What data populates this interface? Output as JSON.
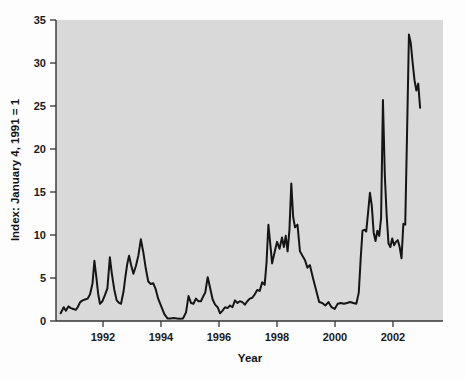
{
  "figure": {
    "background_color": "#fdfdfd",
    "plot_background_color": "#d9d9d9",
    "line_color": "#151515"
  },
  "axes": {
    "y_title": "Index: January 4, 1991 = 1",
    "x_title": "Year",
    "y_ticks": [
      "0",
      "5",
      "10",
      "15",
      "20",
      "25",
      "30",
      "35"
    ],
    "x_ticks": [
      "1992",
      "1994",
      "1996",
      "1998",
      "2000",
      "2002"
    ]
  },
  "chart_data": {
    "type": "line",
    "title": "",
    "xlabel": "Year",
    "ylabel": "Index: January 4, 1991 = 1",
    "xlim": [
      1990.8,
      2003.3
    ],
    "ylim": [
      0,
      35
    ],
    "yticks": [
      0,
      5,
      10,
      15,
      20,
      25,
      30,
      35
    ],
    "xticks": [
      1992,
      1994,
      1996,
      1998,
      2000,
      2002
    ],
    "grid": false,
    "legend": "none",
    "series": [
      {
        "name": "Index",
        "x": [
          1990.95,
          1991.05,
          1991.12,
          1991.2,
          1991.28,
          1991.36,
          1991.44,
          1991.5,
          1991.58,
          1991.66,
          1991.74,
          1991.82,
          1991.9,
          1991.98,
          1992.04,
          1992.1,
          1992.16,
          1992.22,
          1992.3,
          1992.38,
          1992.46,
          1992.54,
          1992.6,
          1992.68,
          1992.76,
          1992.84,
          1992.9,
          1992.98,
          1993.04,
          1993.1,
          1993.16,
          1993.22,
          1993.3,
          1993.38,
          1993.46,
          1993.54,
          1993.62,
          1993.7,
          1993.78,
          1993.86,
          1993.94,
          1994.02,
          1994.1,
          1994.2,
          1994.3,
          1994.4,
          1994.5,
          1994.6,
          1994.7,
          1994.8,
          1994.9,
          1995.0,
          1995.08,
          1995.16,
          1995.24,
          1995.32,
          1995.4,
          1995.48,
          1995.56,
          1995.62,
          1995.7,
          1995.78,
          1995.86,
          1995.94,
          1996.02,
          1996.1,
          1996.18,
          1996.26,
          1996.34,
          1996.42,
          1996.5,
          1996.58,
          1996.66,
          1996.74,
          1996.82,
          1996.9,
          1996.98,
          1997.06,
          1997.14,
          1997.22,
          1997.3,
          1997.38,
          1997.46,
          1997.54,
          1997.6,
          1997.66,
          1997.72,
          1997.78,
          1997.86,
          1997.94,
          1998.02,
          1998.1,
          1998.16,
          1998.22,
          1998.28,
          1998.34,
          1998.4,
          1998.46,
          1998.52,
          1998.6,
          1998.68,
          1998.76,
          1998.84,
          1998.92,
          1999.0,
          1999.1,
          1999.2,
          1999.3,
          1999.4,
          1999.5,
          1999.6,
          1999.7,
          1999.8,
          1999.9,
          2000.0,
          2000.1,
          2000.2,
          2000.3,
          2000.4,
          2000.5,
          2000.58,
          2000.64,
          2000.7,
          2000.76,
          2000.82,
          2000.88,
          2000.94,
          2001.0,
          2001.06,
          2001.12,
          2001.18,
          2001.24,
          2001.3,
          2001.36,
          2001.42,
          2001.48,
          2001.54,
          2001.6,
          2001.66,
          2001.72,
          2001.78,
          2001.84,
          2001.9,
          2001.96,
          2002.02,
          2002.08,
          2002.14,
          2002.2,
          2002.26,
          2002.32,
          2002.38,
          2002.44,
          2002.5,
          2002.56
        ],
        "y": [
          0.9,
          1.6,
          1.2,
          1.7,
          1.5,
          1.4,
          1.3,
          1.6,
          2.2,
          2.4,
          2.5,
          2.6,
          3.1,
          4.4,
          7.0,
          5.2,
          3.2,
          2.0,
          2.3,
          3.0,
          3.8,
          7.4,
          5.6,
          3.7,
          2.4,
          2.1,
          2.0,
          3.4,
          5.1,
          6.6,
          7.6,
          6.6,
          5.5,
          6.4,
          7.6,
          9.5,
          8.0,
          6.1,
          4.6,
          4.3,
          4.4,
          3.7,
          2.6,
          1.7,
          0.8,
          0.3,
          0.3,
          0.35,
          0.3,
          0.25,
          0.3,
          1.0,
          2.9,
          2.1,
          2.0,
          2.6,
          2.3,
          2.3,
          2.9,
          3.3,
          5.1,
          3.8,
          2.5,
          1.9,
          1.6,
          0.9,
          1.2,
          1.6,
          1.5,
          1.8,
          1.6,
          2.4,
          2.1,
          2.3,
          2.2,
          1.9,
          2.3,
          2.6,
          2.7,
          3.1,
          3.6,
          3.5,
          4.5,
          4.2,
          6.8,
          11.2,
          9.0,
          6.7,
          8.0,
          9.2,
          8.4,
          9.7,
          8.6,
          9.9,
          8.1,
          10.6,
          16.0,
          12.1,
          10.9,
          11.2,
          8.1,
          7.6,
          7.1,
          6.2,
          6.5,
          5.0,
          3.6,
          2.2,
          2.1,
          1.8,
          2.2,
          1.6,
          1.4,
          2.0,
          2.1,
          2.0,
          2.1,
          2.2,
          2.1,
          2.0,
          3.3,
          7.2,
          10.5,
          10.6,
          10.4,
          12.6,
          14.9,
          13.4,
          10.3,
          9.3,
          10.5,
          9.9,
          12.0,
          25.7,
          17.0,
          12.3,
          9.0,
          8.6,
          9.6,
          8.8,
          9.2,
          9.4,
          8.6,
          7.3,
          11.3,
          11.2,
          22.0,
          33.3,
          32.3,
          30.0,
          28.0,
          26.8,
          27.6,
          24.8
        ]
      }
    ]
  }
}
